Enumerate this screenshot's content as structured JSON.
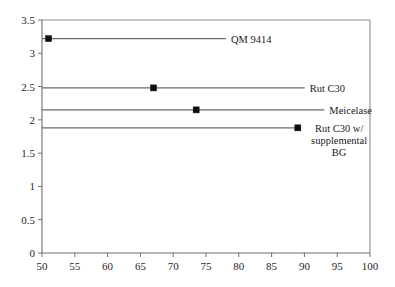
{
  "chart_data": {
    "type": "scatter",
    "title": "",
    "subtitle": "",
    "xlabel": "",
    "ylabel": "",
    "xlim": [
      50,
      100
    ],
    "ylim": [
      0,
      3.5
    ],
    "grid": false,
    "legend_position": "inline-right-labels",
    "xticks": [
      "50",
      "55",
      "60",
      "65",
      "70",
      "75",
      "80",
      "85",
      "90",
      "95",
      "100"
    ],
    "yticks": [
      "0",
      "0.5",
      "1",
      "1.5",
      "2",
      "2.5",
      "3",
      "3.5"
    ],
    "xtick_values": [
      50,
      55,
      60,
      65,
      70,
      75,
      80,
      85,
      90,
      95,
      100
    ],
    "ytick_values": [
      0,
      0.5,
      1,
      1.5,
      2,
      2.5,
      3,
      3.5
    ],
    "series": [
      {
        "name": "QM 9414",
        "label_lines": [
          "QM 9414"
        ],
        "x": 51.0,
        "y": 3.22,
        "line_y": 3.22,
        "label_anchor_x": 78.5,
        "marker": "square",
        "color": "#0d0d0d"
      },
      {
        "name": "Rut C30",
        "label_lines": [
          "Rut C30"
        ],
        "x": 67.0,
        "y": 2.48,
        "line_y": 2.48,
        "label_anchor_x": 90.5,
        "marker": "square",
        "color": "#0d0d0d"
      },
      {
        "name": "Meicelase",
        "label_lines": [
          "Meicelase"
        ],
        "x": 73.5,
        "y": 2.15,
        "line_y": 2.15,
        "label_anchor_x": 93.5,
        "marker": "square",
        "color": "#0d0d0d"
      },
      {
        "name": "Rut C30 w/ supplemental BG",
        "label_lines": [
          "Rut C30 w/",
          "supplemental",
          "BG"
        ],
        "x": 89.0,
        "y": 1.88,
        "line_y": 1.88,
        "label_anchor_x": 89.5,
        "marker": "square",
        "color": "#0d0d0d"
      }
    ]
  },
  "axes": {
    "frame_color": "#8c8c8c",
    "tick_color": "#6e6e6e",
    "line_color": "#6b6b6b",
    "marker_color": "#0d0d0d"
  }
}
